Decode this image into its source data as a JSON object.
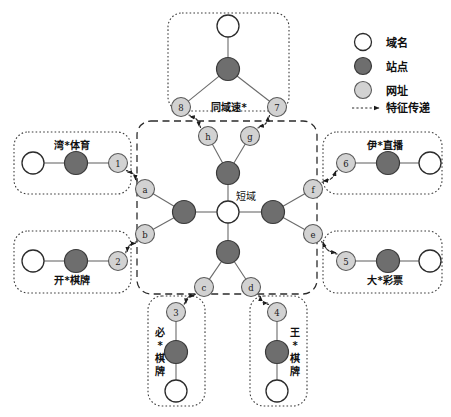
{
  "figure": {
    "hub_label": "短域",
    "legend": {
      "items": [
        {
          "key": "domain",
          "label": "域名",
          "swatch": "domain-circle",
          "color": "#ffffff"
        },
        {
          "key": "station",
          "label": "站点",
          "swatch": "station-circle",
          "color": "#6e6e6e"
        },
        {
          "key": "url",
          "label": "网址",
          "swatch": "url-circle",
          "color": "#d2d2d2"
        },
        {
          "key": "feature",
          "label": "特征传递",
          "swatch": "dashed-arrow",
          "color": "#2b2b2b"
        }
      ]
    },
    "clusters": [
      {
        "id": "top",
        "label": "同域速*",
        "orientation": "horizontal"
      },
      {
        "id": "left-upper",
        "label": "湾*体育",
        "orientation": "horizontal"
      },
      {
        "id": "left-lower",
        "label": "开*棋牌",
        "orientation": "horizontal"
      },
      {
        "id": "right-upper",
        "label": "伊*直播",
        "orientation": "horizontal"
      },
      {
        "id": "right-lower",
        "label": "大*彩票",
        "orientation": "horizontal"
      },
      {
        "id": "bottom-left",
        "label": "必*棋牌",
        "orientation": "vertical"
      },
      {
        "id": "bottom-right",
        "label": "王*棋牌",
        "orientation": "vertical"
      },
      {
        "id": "center",
        "label": "",
        "orientation": "none"
      }
    ],
    "nodes": [
      {
        "id": "hub",
        "type": "domain",
        "label": "",
        "x": 228,
        "y": 212,
        "r": 11
      },
      {
        "id": "s-up",
        "type": "station",
        "label": "",
        "x": 228,
        "y": 173,
        "r": 11.5
      },
      {
        "id": "s-dn",
        "type": "station",
        "label": "",
        "x": 228,
        "y": 252,
        "r": 11.5
      },
      {
        "id": "s-lf",
        "type": "station",
        "label": "",
        "x": 184,
        "y": 212,
        "r": 11.5
      },
      {
        "id": "s-rt",
        "type": "station",
        "label": "",
        "x": 273,
        "y": 212,
        "r": 11.5
      },
      {
        "id": "u-h",
        "type": "url",
        "label": "h",
        "x": 208,
        "y": 136,
        "r": 9.5
      },
      {
        "id": "u-g",
        "type": "url",
        "label": "g",
        "x": 250,
        "y": 136,
        "r": 9.5
      },
      {
        "id": "u-a",
        "type": "url",
        "label": "a",
        "x": 145,
        "y": 189,
        "r": 9.5
      },
      {
        "id": "u-b",
        "type": "url",
        "label": "b",
        "x": 145,
        "y": 234,
        "r": 9.5
      },
      {
        "id": "u-f",
        "type": "url",
        "label": "f",
        "x": 313,
        "y": 189,
        "r": 9.5
      },
      {
        "id": "u-e",
        "type": "url",
        "label": "e",
        "x": 313,
        "y": 234,
        "r": 9.5
      },
      {
        "id": "u-c",
        "type": "url",
        "label": "c",
        "x": 204,
        "y": 287,
        "r": 9.5
      },
      {
        "id": "u-d",
        "type": "url",
        "label": "d",
        "x": 251,
        "y": 287,
        "r": 9.5
      },
      {
        "id": "u-8",
        "type": "url",
        "label": "8",
        "x": 181,
        "y": 107,
        "r": 9.5
      },
      {
        "id": "u-7",
        "type": "url",
        "label": "7",
        "x": 277,
        "y": 107,
        "r": 9.5
      },
      {
        "id": "u-1",
        "type": "url",
        "label": "1",
        "x": 118,
        "y": 163,
        "r": 9.5
      },
      {
        "id": "u-2",
        "type": "url",
        "label": "2",
        "x": 118,
        "y": 261,
        "r": 9.5
      },
      {
        "id": "u-6",
        "type": "url",
        "label": "6",
        "x": 346,
        "y": 163,
        "r": 9.5
      },
      {
        "id": "u-5",
        "type": "url",
        "label": "5",
        "x": 346,
        "y": 261,
        "r": 9.5
      },
      {
        "id": "u-3",
        "type": "url",
        "label": "3",
        "x": 176,
        "y": 312,
        "r": 9.5
      },
      {
        "id": "u-4",
        "type": "url",
        "label": "4",
        "x": 277,
        "y": 312,
        "r": 9.5
      },
      {
        "id": "t-station",
        "type": "station",
        "label": "",
        "x": 228,
        "y": 69,
        "r": 11.5
      },
      {
        "id": "t-domain",
        "type": "domain",
        "label": "",
        "x": 228,
        "y": 26,
        "r": 11
      },
      {
        "id": "lu-station",
        "type": "station",
        "label": "",
        "x": 76,
        "y": 163,
        "r": 11.5
      },
      {
        "id": "lu-domain",
        "type": "domain",
        "label": "",
        "x": 33,
        "y": 163,
        "r": 11
      },
      {
        "id": "ll-station",
        "type": "station",
        "label": "",
        "x": 76,
        "y": 261,
        "r": 11.5
      },
      {
        "id": "ll-domain",
        "type": "domain",
        "label": "",
        "x": 33,
        "y": 261,
        "r": 11
      },
      {
        "id": "ru-station",
        "type": "station",
        "label": "",
        "x": 388,
        "y": 163,
        "r": 11.5
      },
      {
        "id": "ru-domain",
        "type": "domain",
        "label": "",
        "x": 430,
        "y": 163,
        "r": 11
      },
      {
        "id": "rl-station",
        "type": "station",
        "label": "",
        "x": 388,
        "y": 261,
        "r": 11.5
      },
      {
        "id": "rl-domain",
        "type": "domain",
        "label": "",
        "x": 430,
        "y": 261,
        "r": 11
      },
      {
        "id": "bl-station",
        "type": "station",
        "label": "",
        "x": 176,
        "y": 352,
        "r": 11.5
      },
      {
        "id": "bl-domain",
        "type": "domain",
        "label": "",
        "x": 176,
        "y": 391,
        "r": 11
      },
      {
        "id": "br-station",
        "type": "station",
        "label": "",
        "x": 277,
        "y": 352,
        "r": 11.5
      },
      {
        "id": "br-domain",
        "type": "domain",
        "label": "",
        "x": 277,
        "y": 391,
        "r": 11
      }
    ],
    "edges_solid": [
      [
        "hub",
        "s-up"
      ],
      [
        "hub",
        "s-dn"
      ],
      [
        "hub",
        "s-lf"
      ],
      [
        "hub",
        "s-rt"
      ],
      [
        "s-up",
        "u-h"
      ],
      [
        "s-up",
        "u-g"
      ],
      [
        "s-lf",
        "u-a"
      ],
      [
        "s-lf",
        "u-b"
      ],
      [
        "s-rt",
        "u-f"
      ],
      [
        "s-rt",
        "u-e"
      ],
      [
        "s-dn",
        "u-c"
      ],
      [
        "s-dn",
        "u-d"
      ],
      [
        "t-domain",
        "t-station"
      ],
      [
        "t-station",
        "u-8"
      ],
      [
        "t-station",
        "u-7"
      ],
      [
        "lu-domain",
        "lu-station"
      ],
      [
        "lu-station",
        "u-1"
      ],
      [
        "ll-domain",
        "ll-station"
      ],
      [
        "ll-station",
        "u-2"
      ],
      [
        "ru-domain",
        "ru-station"
      ],
      [
        "ru-station",
        "u-6"
      ],
      [
        "rl-domain",
        "rl-station"
      ],
      [
        "rl-station",
        "u-5"
      ],
      [
        "u-3",
        "bl-station"
      ],
      [
        "bl-station",
        "bl-domain"
      ],
      [
        "u-4",
        "br-station"
      ],
      [
        "br-station",
        "br-domain"
      ]
    ],
    "edges_feature": [
      [
        "u-a",
        "u-1"
      ],
      [
        "u-1",
        "u-a"
      ],
      [
        "u-b",
        "u-2"
      ],
      [
        "u-2",
        "u-b"
      ],
      [
        "u-f",
        "u-6"
      ],
      [
        "u-6",
        "u-f"
      ],
      [
        "u-e",
        "u-5"
      ],
      [
        "u-5",
        "u-e"
      ],
      [
        "u-h",
        "u-8"
      ],
      [
        "u-8",
        "u-h"
      ],
      [
        "u-g",
        "u-7"
      ],
      [
        "u-7",
        "u-g"
      ],
      [
        "u-c",
        "u-3"
      ],
      [
        "u-3",
        "u-c"
      ],
      [
        "u-d",
        "u-4"
      ],
      [
        "u-4",
        "u-d"
      ]
    ]
  }
}
